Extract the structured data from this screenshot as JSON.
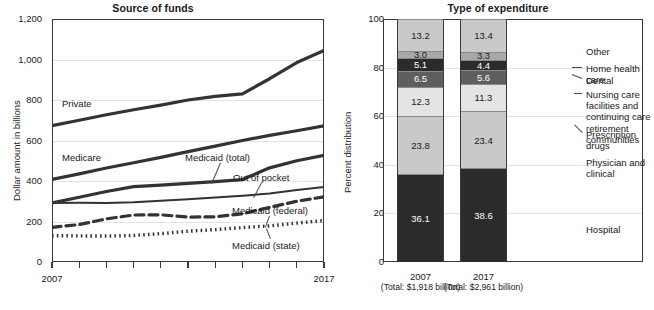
{
  "chart_data": [
    {
      "type": "line",
      "title": "Source of funds",
      "xlabel": "",
      "ylabel": "Dollar amount in billions",
      "ylim": [
        0,
        1200
      ],
      "yticks": [
        "0",
        "200",
        "400",
        "600",
        "800",
        "1,000",
        "1,200"
      ],
      "ytick_values": [
        0,
        200,
        400,
        600,
        800,
        1000,
        1200
      ],
      "xlim": [
        2007,
        2017
      ],
      "xticks": [
        "2007",
        "2017"
      ],
      "xtick_values": [
        2007,
        2017
      ],
      "x": [
        2007,
        2008,
        2009,
        2010,
        2011,
        2012,
        2013,
        2014,
        2015,
        2016,
        2017
      ],
      "grid": true,
      "legend_position": "inline-annotations",
      "series": [
        {
          "name": "Private",
          "style": "solid-thick",
          "label": "Private",
          "values": [
            673,
            700,
            727,
            752,
            775,
            800,
            818,
            830,
            905,
            985,
            1045
          ]
        },
        {
          "name": "Medicare",
          "style": "solid-thick",
          "label": "Medicare",
          "values": [
            408,
            435,
            464,
            490,
            517,
            545,
            572,
            600,
            625,
            648,
            672
          ]
        },
        {
          "name": "Medicaid (total)",
          "style": "solid-thick",
          "label": "Medicaid (total)",
          "values": [
            292,
            320,
            348,
            372,
            380,
            388,
            397,
            407,
            465,
            500,
            527
          ]
        },
        {
          "name": "Out of pocket",
          "style": "solid-thin",
          "label": "Out of pocket",
          "values": [
            291,
            292,
            291,
            295,
            303,
            310,
            318,
            327,
            338,
            355,
            370
          ]
        },
        {
          "name": "Medicaid (federal)",
          "style": "dashed",
          "label": "Medicaid (federal)",
          "values": [
            171,
            185,
            213,
            232,
            233,
            222,
            223,
            238,
            270,
            300,
            322
          ]
        },
        {
          "name": "Medicaid (state)",
          "style": "dotted",
          "label": "Medicaid (state)",
          "values": [
            130,
            129,
            128,
            131,
            140,
            152,
            160,
            170,
            178,
            192,
            205
          ]
        }
      ]
    },
    {
      "type": "bar",
      "subtype": "stacked-percent",
      "title": "Type of expenditure",
      "xlabel": "",
      "ylabel": "Percent distribution",
      "ylim": [
        0,
        100
      ],
      "yticks": [
        "0",
        "20",
        "40",
        "60",
        "80",
        "100"
      ],
      "ytick_values": [
        0,
        20,
        40,
        60,
        80,
        100
      ],
      "grid": true,
      "categories": [
        "2007",
        "2017"
      ],
      "category_totals": [
        "(Total: $1,918\nbillion)",
        "(Total: $2,961\nbillion)"
      ],
      "legend_position": "right",
      "stack_order_bottom_to_top": [
        "Hospital",
        "Physician and clinical",
        "Prescription drugs",
        "Nursing care facilities and continuing care retirement communities",
        "Dental",
        "Home health care",
        "Other"
      ],
      "series": [
        {
          "name": "Hospital",
          "label": "Hospital",
          "color": "#2b2b2b",
          "text_color": "#ffffff",
          "values": [
            36.1,
            38.6
          ],
          "value_labels": [
            "36.1",
            "38.6"
          ]
        },
        {
          "name": "Physician and clinical",
          "label": "Physician and clinical",
          "color": "#c9c9c9",
          "text_color": "#1a1a1a",
          "values": [
            23.8,
            23.4
          ],
          "value_labels": [
            "23.8",
            "23.4"
          ]
        },
        {
          "name": "Prescription drugs",
          "label": "Prescription drugs",
          "color": "#e4e4e4",
          "text_color": "#1a1a1a",
          "values": [
            12.3,
            11.3
          ],
          "value_labels": [
            "12.3",
            "11.3"
          ]
        },
        {
          "name": "Nursing care facilities and continuing care retirement communities",
          "label": "Nursing care facilities and\ncontinuing care retirement\ncommunities",
          "color": "#5e5e5e",
          "text_color": "#ffffff",
          "values": [
            6.5,
            5.6
          ],
          "value_labels": [
            "6.5",
            "5.6"
          ]
        },
        {
          "name": "Dental",
          "label": "Dental",
          "color": "#2b2b2b",
          "text_color": "#ffffff",
          "values": [
            5.1,
            4.4
          ],
          "value_labels": [
            "5.1",
            "4.4"
          ]
        },
        {
          "name": "Home health care",
          "label": "Home health care",
          "color": "#a8a8a8",
          "text_color": "#1a1a1a",
          "values": [
            3.0,
            3.3
          ],
          "value_labels": [
            "3.0",
            "3.3"
          ]
        },
        {
          "name": "Other",
          "label": "Other",
          "color": "#c9c9c9",
          "text_color": "#1a1a1a",
          "values": [
            13.2,
            13.4
          ],
          "value_labels": [
            "13.2",
            "13.4"
          ]
        }
      ]
    }
  ]
}
